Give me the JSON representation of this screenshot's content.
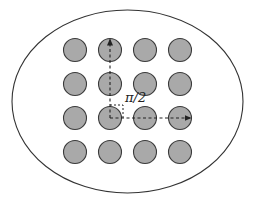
{
  "diagram": {
    "title": "",
    "boundary": {
      "shape": "ellipse",
      "stroke": "#333333",
      "fill": "#ffffff"
    },
    "lattice": {
      "rows": 4,
      "cols": 4,
      "particle_fill": "#a9a9a9",
      "particle_stroke": "#3a3a3a"
    },
    "vectors": [
      {
        "name": "vertical-lattice-vector",
        "from": [
          1,
          2
        ],
        "to": [
          1,
          0
        ],
        "style": "dashed"
      },
      {
        "name": "horizontal-lattice-vector",
        "from": [
          1,
          2
        ],
        "to": [
          3,
          2
        ],
        "style": "dashed"
      }
    ],
    "angle": {
      "label": "π/2",
      "marker": "right-angle-dashed"
    }
  }
}
